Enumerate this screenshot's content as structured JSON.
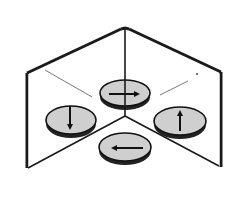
{
  "diagram": {
    "description": "Two plane mirrors hinged at a right angle with a coin and its three reflected images",
    "colors": {
      "background": "#ffffff",
      "line": "#1a1a1a",
      "coin_fill": "#cfcfcf",
      "coin_edge": "#111111"
    },
    "mirrors": [
      {
        "name": "left-mirror",
        "top": [
          [
            27,
            73
          ],
          [
            121,
            29
          ]
        ],
        "side": [
          [
            27,
            73
          ],
          [
            27,
            168
          ]
        ],
        "bottom": [
          [
            28,
            168
          ],
          [
            125,
            116
          ]
        ]
      },
      {
        "name": "right-mirror",
        "top": [
          [
            129,
            29
          ],
          [
            221,
            72
          ]
        ],
        "side": [
          [
            221,
            72
          ],
          [
            221,
            167
          ]
        ],
        "bottom": [
          [
            125,
            116
          ],
          [
            219,
            166
          ]
        ]
      }
    ],
    "hinge": {
      "x": 125,
      "y1": 29,
      "y2": 116
    },
    "coins": [
      {
        "name": "object-coin",
        "label": "object",
        "cx": 125,
        "cy": 147,
        "arrow": "left"
      },
      {
        "name": "image-coin-left",
        "label": "image in left mirror",
        "cx": 71,
        "cy": 120,
        "arrow": "down"
      },
      {
        "name": "image-coin-right",
        "label": "image in right mirror",
        "cx": 180,
        "cy": 121,
        "arrow": "up"
      },
      {
        "name": "image-coin-double",
        "label": "double reflection",
        "cx": 125,
        "cy": 93,
        "arrow": "right"
      }
    ]
  }
}
